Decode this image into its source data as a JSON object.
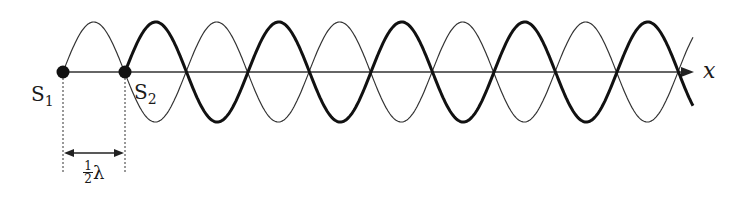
{
  "diagram": {
    "source1": {
      "label": "S",
      "subscript": "1"
    },
    "source2": {
      "label": "S",
      "subscript": "2"
    },
    "axis_label": "x",
    "separation_label": {
      "numerator": "1",
      "denominator": "2",
      "symbol": "λ"
    },
    "waves": [
      {
        "name": "wave-from-S1",
        "style": "thin",
        "start_x_px": 63,
        "end_x_px": 693
      },
      {
        "name": "wave-from-S2",
        "style": "thick",
        "start_x_px": 125,
        "end_x_px": 693
      }
    ],
    "colors": {
      "ink": "#1a1a1a",
      "background": "#ffffff"
    },
    "geometry": {
      "axis_y": 72,
      "amplitude": 50,
      "half_wavelength": 61.5
    }
  }
}
